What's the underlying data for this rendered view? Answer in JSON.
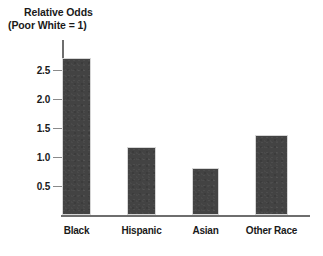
{
  "chart_data": {
    "type": "bar",
    "title": "Relative Odds",
    "subtitle": "(Poor White = 1)",
    "xlabel": "",
    "ylabel": "Relative Odds (Poor White = 1)",
    "categories": [
      "Black",
      "Hispanic",
      "Asian",
      "Other Race"
    ],
    "values": [
      2.71,
      1.17,
      0.81,
      1.38
    ],
    "ylim": [
      0,
      2.95
    ],
    "yticks": [
      0.5,
      1.0,
      1.5,
      2.0,
      2.5
    ],
    "ytick_labels": [
      "0.5",
      "1.0",
      "1.5",
      "2.0",
      "2.5"
    ],
    "grid": false,
    "legend": null,
    "bar_color": "#434343",
    "axis_color": "#6e6e6e",
    "text_color": "#1a1a1a",
    "background_color": "#ffffff"
  },
  "title": {
    "line1": "Relative Odds",
    "line2": "(Poor White = 1)"
  }
}
